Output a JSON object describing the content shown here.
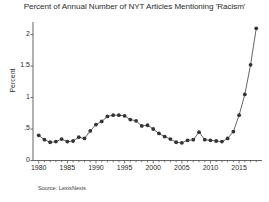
{
  "chart_data": {
    "type": "line",
    "title": "Percent of Annual Number of NYT Articles Mentioning 'Racism'",
    "xlabel": "",
    "ylabel": "Percent",
    "source": "Source: LexisNexis",
    "xlim": [
      1979,
      2019
    ],
    "ylim": [
      0,
      2.2
    ],
    "grid": false,
    "legend": false,
    "marker": "circle",
    "line_color": "#555555",
    "marker_color": "#333333",
    "y_ticks": [
      0,
      0.5,
      1,
      1.5,
      2
    ],
    "y_tick_labels": [
      "0",
      ".5",
      "1",
      "1.5",
      "2"
    ],
    "x_ticks": [
      1980,
      1985,
      1990,
      1995,
      2000,
      2005,
      2010,
      2015
    ],
    "x_tick_labels": [
      "1980",
      "1985",
      "1990",
      "1995",
      "2000",
      "2005",
      "2010",
      "2015"
    ],
    "x": [
      1980,
      1981,
      1982,
      1983,
      1984,
      1985,
      1986,
      1987,
      1988,
      1989,
      1990,
      1991,
      1992,
      1993,
      1994,
      1995,
      1996,
      1997,
      1998,
      1999,
      2000,
      2001,
      2002,
      2003,
      2004,
      2005,
      2006,
      2007,
      2008,
      2009,
      2010,
      2011,
      2012,
      2013,
      2014,
      2015,
      2016,
      2017,
      2018
    ],
    "values": [
      0.4,
      0.33,
      0.29,
      0.3,
      0.34,
      0.3,
      0.31,
      0.37,
      0.35,
      0.47,
      0.57,
      0.62,
      0.7,
      0.72,
      0.72,
      0.71,
      0.65,
      0.63,
      0.55,
      0.56,
      0.5,
      0.43,
      0.38,
      0.34,
      0.29,
      0.28,
      0.32,
      0.33,
      0.45,
      0.33,
      0.32,
      0.31,
      0.3,
      0.35,
      0.46,
      0.72,
      1.05,
      1.52,
      2.1
    ],
    "series": [
      {
        "name": "Percent of NYT articles mentioning 'Racism'",
        "values": [
          0.4,
          0.33,
          0.29,
          0.3,
          0.34,
          0.3,
          0.31,
          0.37,
          0.35,
          0.47,
          0.57,
          0.62,
          0.7,
          0.72,
          0.72,
          0.71,
          0.65,
          0.63,
          0.55,
          0.56,
          0.5,
          0.43,
          0.38,
          0.34,
          0.29,
          0.28,
          0.32,
          0.33,
          0.45,
          0.33,
          0.32,
          0.31,
          0.3,
          0.35,
          0.46,
          0.72,
          1.05,
          1.52,
          2.1
        ]
      }
    ]
  }
}
